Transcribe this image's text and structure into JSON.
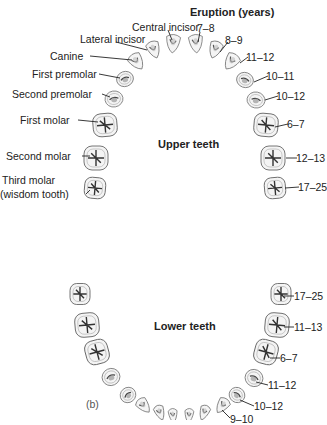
{
  "diagram": {
    "header": "Eruption (years)",
    "upper": {
      "title": "Upper teeth",
      "left_labels": [
        "Central incisor",
        "Lateral incisor",
        "Canine",
        "First premolar",
        "Second premolar",
        "First molar",
        "Second molar",
        "Third molar",
        "(wisdom tooth)"
      ],
      "right_ages": [
        "7–8",
        "8–9",
        "11–12",
        "10–11",
        "10–12",
        "6–7",
        "12–13",
        "17–25"
      ]
    },
    "lower": {
      "title": "Lower teeth",
      "panel_label": "(b)",
      "right_ages": [
        "17–25",
        "11–13",
        "6–7",
        "11–12",
        "10–12",
        "9–10"
      ]
    }
  }
}
